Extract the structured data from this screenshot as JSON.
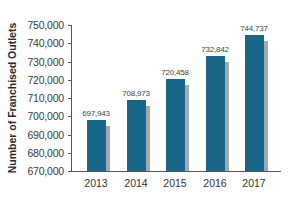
{
  "chart_data": {
    "type": "bar",
    "title": "",
    "xlabel": "",
    "ylabel": "Number of Franchised Outlets",
    "categories": [
      "2013",
      "2014",
      "2015",
      "2016",
      "2017"
    ],
    "values": [
      697943,
      708973,
      720458,
      732842,
      744737
    ],
    "data_labels": [
      "697,943",
      "708,973",
      "720,458",
      "732,842",
      "744,737"
    ],
    "ylim": [
      670000,
      750000
    ],
    "yticks": [
      670000,
      680000,
      690000,
      700000,
      710000,
      720000,
      730000,
      740000,
      750000
    ],
    "ytick_labels": [
      "670,000",
      "680,000",
      "690,000",
      "700,000",
      "710,000",
      "720,000",
      "730,000",
      "740,000",
      "750,000"
    ],
    "grid": false,
    "legend": null,
    "colors": {
      "bar": "#1a6688",
      "shadow": "#a6a8ab"
    }
  }
}
